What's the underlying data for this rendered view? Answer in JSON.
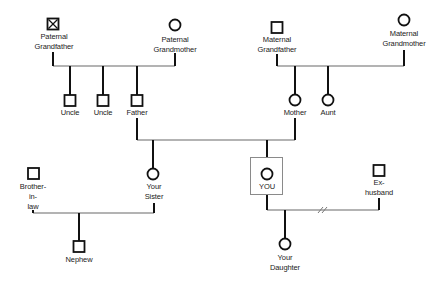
{
  "diagram": {
    "type": "family-tree-genogram",
    "colors": {
      "symbol_stroke": "#111111",
      "marriage_line": "#9a9a9a",
      "descent_line": "#111111",
      "highlight_box": "#8a8a8a",
      "text": "#222222"
    },
    "people": {
      "paternal_grandfather": {
        "line1": "Paternal",
        "line2": "Grandfather",
        "sex": "male",
        "deceased": true
      },
      "paternal_grandmother": {
        "line1": "Paternal",
        "line2": "Grandmother",
        "sex": "female"
      },
      "maternal_grandfather": {
        "line1": "Maternal",
        "line2": "Grandfather",
        "sex": "male"
      },
      "maternal_grandmother": {
        "line1": "Maternal",
        "line2": "Grandmother",
        "sex": "female"
      },
      "uncle1": {
        "label": "Uncle",
        "sex": "male"
      },
      "uncle2": {
        "label": "Uncle",
        "sex": "male"
      },
      "father": {
        "label": "Father",
        "sex": "male"
      },
      "mother": {
        "label": "Mother",
        "sex": "female"
      },
      "aunt": {
        "label": "Aunt",
        "sex": "female"
      },
      "brother_in_law": {
        "line1": "Brother-",
        "line2": "in-",
        "line3": "law",
        "sex": "male"
      },
      "sister": {
        "line1": "Your",
        "line2": "Sister",
        "sex": "female"
      },
      "you": {
        "label": "YOU",
        "sex": "female",
        "highlighted": true
      },
      "ex_husband": {
        "line1": "Ex-",
        "line2": "husband",
        "sex": "male"
      },
      "nephew": {
        "label": "Nephew",
        "sex": "male"
      },
      "daughter": {
        "line1": "Your",
        "line2": "Daughter",
        "sex": "female"
      }
    },
    "relationships": [
      {
        "type": "marriage",
        "a": "paternal_grandfather",
        "b": "paternal_grandmother",
        "children": [
          "uncle1",
          "uncle2",
          "father"
        ]
      },
      {
        "type": "marriage",
        "a": "maternal_grandfather",
        "b": "maternal_grandmother",
        "children": [
          "mother",
          "aunt"
        ]
      },
      {
        "type": "marriage",
        "a": "father",
        "b": "mother",
        "children": [
          "sister",
          "you"
        ]
      },
      {
        "type": "marriage",
        "a": "brother_in_law",
        "b": "sister",
        "children": [
          "nephew"
        ]
      },
      {
        "type": "divorce",
        "a": "you",
        "b": "ex_husband",
        "children": [
          "daughter"
        ],
        "marker": "//"
      }
    ]
  }
}
